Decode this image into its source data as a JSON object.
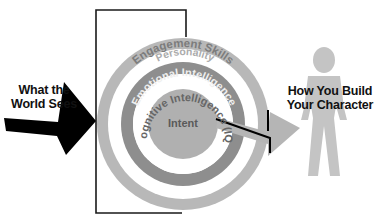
{
  "diagram": {
    "title": "",
    "left_label": {
      "line1": "What the",
      "line2": "World Sees"
    },
    "right_label": {
      "line1": "How You Build",
      "line2": "Your Character"
    },
    "rings": [
      {
        "label": "Engagement Skills",
        "color": "#b8b8b8",
        "text_color": "#808080"
      },
      {
        "label": "Personality",
        "color": "#e8e8e8",
        "text_color": "#a9a9a9"
      },
      {
        "label": "Emotional Intelligence",
        "color": "#8e8e8e",
        "text_color": "#e6e6e6"
      },
      {
        "label": "Cognitive Intelligence (IQ)",
        "color": "#ffffff",
        "text_color": "#6a6a6a"
      },
      {
        "label": "Intent",
        "color": "#b0b0b0",
        "text_color": "#5a5a5a"
      }
    ],
    "colors": {
      "frame": "#1a1a1a",
      "left_arrow": "#000000",
      "right_arrow": "#b5b5b5",
      "figure": "#c4c4c4"
    }
  }
}
